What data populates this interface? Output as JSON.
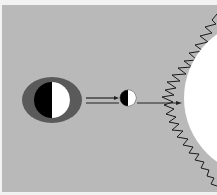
{
  "diagram": {
    "type": "sun-moon-earth alignment",
    "colors": {
      "background": "#b9b9b9",
      "border": "#f2f2f2",
      "halo": "#5a5a5a",
      "dark_side": "#000000",
      "light_side": "#ffffff",
      "sun": "#ffffff",
      "corona_outline": "#1a1a1a",
      "arrow": "#222222"
    },
    "bodies": [
      {
        "name": "earth",
        "cx": 52,
        "cy": 100,
        "r": 18
      },
      {
        "name": "moon",
        "cx": 128,
        "cy": 98,
        "r": 8
      },
      {
        "name": "sun",
        "cx": 262,
        "cy": 98,
        "r": 78
      }
    ]
  }
}
